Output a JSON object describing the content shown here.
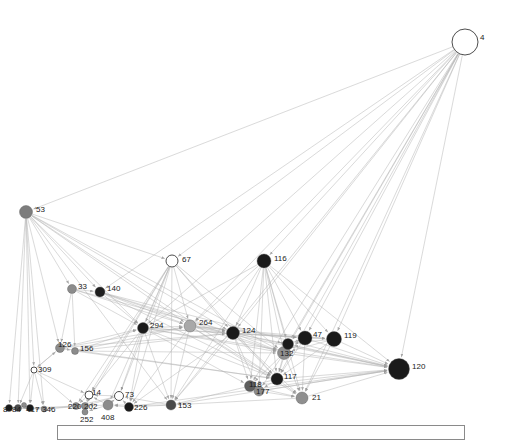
{
  "figure": {
    "type": "network-graph",
    "width": 511,
    "height": 440,
    "background": "#ffffff",
    "edge_color": "#b0b0b0",
    "arrow_color": "#9a9a9a",
    "label_color": "#1a1a1a",
    "node_stroke": "#555555"
  },
  "legend_panel": {
    "x": 57,
    "y": 425,
    "width": 408,
    "height": 15,
    "border_color": "#8a8a8a"
  },
  "chart_data": {
    "type": "scatter",
    "title": "",
    "xlabel": "",
    "ylabel": "",
    "nodes": [
      {
        "id": "4",
        "x": 465,
        "y": 42,
        "r": 13.0,
        "color": "#ffffff"
      },
      {
        "id": "53",
        "x": 26,
        "y": 212,
        "r": 6.5,
        "color": "#7d7d7d"
      },
      {
        "id": "67",
        "x": 172,
        "y": 261,
        "r": 6.0,
        "color": "#ffffff"
      },
      {
        "id": "116",
        "x": 264,
        "y": 261,
        "r": 7.0,
        "color": "#1a1a1a"
      },
      {
        "id": "33",
        "x": 72,
        "y": 289,
        "r": 4.5,
        "color": "#8c8c8c"
      },
      {
        "id": "140",
        "x": 100,
        "y": 292,
        "r": 5.0,
        "color": "#1f1f1f"
      },
      {
        "id": "294",
        "x": 143,
        "y": 328,
        "r": 5.5,
        "color": "#1a1a1a"
      },
      {
        "id": "264",
        "x": 190,
        "y": 326,
        "r": 6.0,
        "color": "#a8a8a8"
      },
      {
        "id": "124",
        "x": 233,
        "y": 333,
        "r": 6.5,
        "color": "#1a1a1a"
      },
      {
        "id": "47",
        "x": 305,
        "y": 338,
        "r": 7.0,
        "color": "#1a1a1a"
      },
      {
        "id": "119",
        "x": 334,
        "y": 339,
        "r": 7.5,
        "color": "#1a1a1a"
      },
      {
        "id": "126",
        "x": 60,
        "y": 348,
        "r": 4.5,
        "color": "#8c8c8c"
      },
      {
        "id": "156",
        "x": 75,
        "y": 351,
        "r": 3.5,
        "color": "#8c8c8c"
      },
      {
        "id": "132",
        "x": 284,
        "y": 353,
        "r": 6.5,
        "color": "#8f8f8f"
      },
      {
        "id": "286",
        "x": 288,
        "y": 344,
        "r": 5.5,
        "color": "#1a1a1a"
      },
      {
        "id": "309",
        "x": 34,
        "y": 370,
        "r": 3.0,
        "color": "#ffffff"
      },
      {
        "id": "120",
        "x": 399,
        "y": 369,
        "r": 10.5,
        "color": "#1a1a1a"
      },
      {
        "id": "117",
        "x": 277,
        "y": 379,
        "r": 6.0,
        "color": "#1a1a1a"
      },
      {
        "id": "118",
        "x": 250,
        "y": 386,
        "r": 5.5,
        "color": "#5e5e5e"
      },
      {
        "id": "177",
        "x": 259,
        "y": 391,
        "r": 5.0,
        "color": "#8c8c8c"
      },
      {
        "id": "21",
        "x": 302,
        "y": 398,
        "r": 6.0,
        "color": "#8f8f8f"
      },
      {
        "id": "14",
        "x": 89,
        "y": 395,
        "r": 4.0,
        "color": "#ffffff"
      },
      {
        "id": "73",
        "x": 119,
        "y": 396,
        "r": 4.5,
        "color": "#ffffff"
      },
      {
        "id": "220",
        "x": 76,
        "y": 406,
        "r": 3.5,
        "color": "#8c8c8c"
      },
      {
        "id": "202",
        "x": 85,
        "y": 406,
        "r": 3.5,
        "color": "#8c8c8c"
      },
      {
        "id": "252",
        "x": 85,
        "y": 412,
        "r": 3.0,
        "color": "#8c8c8c"
      },
      {
        "id": "408",
        "x": 108,
        "y": 405,
        "r": 5.0,
        "color": "#8c8c8c"
      },
      {
        "id": "226",
        "x": 129,
        "y": 407,
        "r": 4.5,
        "color": "#1a1a1a"
      },
      {
        "id": "153",
        "x": 171,
        "y": 405,
        "r": 5.0,
        "color": "#4a4a4a"
      },
      {
        "id": "346",
        "x": 44,
        "y": 409,
        "r": 3.0,
        "color": "#8c8c8c"
      },
      {
        "id": "417",
        "x": 30,
        "y": 408,
        "r": 3.5,
        "color": "#1a1a1a"
      },
      {
        "id": "84",
        "x": 18,
        "y": 408,
        "r": 3.5,
        "color": "#4a4a4a"
      },
      {
        "id": "8",
        "x": 9,
        "y": 408,
        "r": 3.5,
        "color": "#1a1a1a"
      },
      {
        "id": "3",
        "x": 24,
        "y": 405,
        "r": 2.5,
        "color": "#8c8c8c"
      }
    ],
    "labels": [
      {
        "text": "4",
        "x": 480,
        "y": 34
      },
      {
        "text": "53",
        "x": 36,
        "y": 206
      },
      {
        "text": "67",
        "x": 182,
        "y": 256
      },
      {
        "text": "116",
        "x": 274,
        "y": 255
      },
      {
        "text": "33",
        "x": 78,
        "y": 283
      },
      {
        "text": "140",
        "x": 107,
        "y": 285
      },
      {
        "text": "294",
        "x": 150,
        "y": 322
      },
      {
        "text": "264",
        "x": 199,
        "y": 319
      },
      {
        "text": "124",
        "x": 242,
        "y": 327
      },
      {
        "text": "47",
        "x": 313,
        "y": 331
      },
      {
        "text": "119",
        "x": 344,
        "y": 332
      },
      {
        "text": "126",
        "x": 58,
        "y": 341
      },
      {
        "text": "156",
        "x": 80,
        "y": 345
      },
      {
        "text": "132",
        "x": 280,
        "y": 350
      },
      {
        "text": "309",
        "x": 38,
        "y": 366
      },
      {
        "text": "120",
        "x": 412,
        "y": 363
      },
      {
        "text": "117",
        "x": 284,
        "y": 373
      },
      {
        "text": "118",
        "x": 249,
        "y": 381
      },
      {
        "text": "177",
        "x": 256,
        "y": 388
      },
      {
        "text": "21",
        "x": 312,
        "y": 394
      },
      {
        "text": "14",
        "x": 92,
        "y": 389
      },
      {
        "text": "73",
        "x": 125,
        "y": 391
      },
      {
        "text": "220",
        "x": 68,
        "y": 403
      },
      {
        "text": "202",
        "x": 84,
        "y": 403
      },
      {
        "text": "252",
        "x": 80,
        "y": 416
      },
      {
        "text": "408",
        "x": 101,
        "y": 414
      },
      {
        "text": "226",
        "x": 134,
        "y": 404
      },
      {
        "text": "153",
        "x": 178,
        "y": 402
      },
      {
        "text": "346",
        "x": 42,
        "y": 406
      },
      {
        "text": "417",
        "x": 26,
        "y": 406
      },
      {
        "text": "84",
        "x": 12,
        "y": 406
      },
      {
        "text": "8",
        "x": 3,
        "y": 406
      }
    ],
    "edges": [
      [
        "4",
        "53"
      ],
      [
        "4",
        "67"
      ],
      [
        "4",
        "116"
      ],
      [
        "4",
        "294"
      ],
      [
        "4",
        "264"
      ],
      [
        "4",
        "124"
      ],
      [
        "4",
        "47"
      ],
      [
        "4",
        "119"
      ],
      [
        "4",
        "132"
      ],
      [
        "4",
        "120"
      ],
      [
        "4",
        "117"
      ],
      [
        "4",
        "21"
      ],
      [
        "4",
        "140"
      ],
      [
        "4",
        "153"
      ],
      [
        "4",
        "118"
      ],
      [
        "4",
        "286"
      ],
      [
        "53",
        "33"
      ],
      [
        "53",
        "140"
      ],
      [
        "53",
        "126"
      ],
      [
        "53",
        "8"
      ],
      [
        "53",
        "84"
      ],
      [
        "53",
        "417"
      ],
      [
        "53",
        "346"
      ],
      [
        "53",
        "309"
      ],
      [
        "53",
        "67"
      ],
      [
        "53",
        "294"
      ],
      [
        "67",
        "294"
      ],
      [
        "67",
        "264"
      ],
      [
        "67",
        "124"
      ],
      [
        "67",
        "132"
      ],
      [
        "67",
        "117"
      ],
      [
        "67",
        "14"
      ],
      [
        "67",
        "73"
      ],
      [
        "67",
        "220"
      ],
      [
        "67",
        "202"
      ],
      [
        "67",
        "408"
      ],
      [
        "116",
        "294"
      ],
      [
        "116",
        "264"
      ],
      [
        "116",
        "124"
      ],
      [
        "116",
        "132"
      ],
      [
        "116",
        "47"
      ],
      [
        "116",
        "119"
      ],
      [
        "116",
        "117"
      ],
      [
        "116",
        "120"
      ],
      [
        "116",
        "118"
      ],
      [
        "116",
        "177"
      ],
      [
        "116",
        "21"
      ],
      [
        "116",
        "153"
      ],
      [
        "116",
        "286"
      ],
      [
        "33",
        "140"
      ],
      [
        "33",
        "126"
      ],
      [
        "33",
        "156"
      ],
      [
        "33",
        "294"
      ],
      [
        "140",
        "294"
      ],
      [
        "140",
        "264"
      ],
      [
        "140",
        "124"
      ],
      [
        "140",
        "120"
      ],
      [
        "126",
        "156"
      ],
      [
        "126",
        "294"
      ],
      [
        "126",
        "124"
      ],
      [
        "126",
        "264"
      ],
      [
        "126",
        "309"
      ],
      [
        "156",
        "294"
      ],
      [
        "156",
        "124"
      ],
      [
        "156",
        "132"
      ],
      [
        "309",
        "84"
      ],
      [
        "309",
        "417"
      ],
      [
        "309",
        "346"
      ],
      [
        "309",
        "220"
      ],
      [
        "294",
        "264"
      ],
      [
        "294",
        "124"
      ],
      [
        "294",
        "132"
      ],
      [
        "294",
        "117"
      ],
      [
        "294",
        "118"
      ],
      [
        "294",
        "226"
      ],
      [
        "294",
        "153"
      ],
      [
        "294",
        "120"
      ],
      [
        "294",
        "47"
      ],
      [
        "264",
        "124"
      ],
      [
        "264",
        "132"
      ],
      [
        "264",
        "47"
      ],
      [
        "264",
        "119"
      ],
      [
        "264",
        "120"
      ],
      [
        "264",
        "117"
      ],
      [
        "264",
        "21"
      ],
      [
        "264",
        "153"
      ],
      [
        "124",
        "132"
      ],
      [
        "124",
        "47"
      ],
      [
        "124",
        "119"
      ],
      [
        "124",
        "117"
      ],
      [
        "124",
        "118"
      ],
      [
        "124",
        "177"
      ],
      [
        "124",
        "21"
      ],
      [
        "124",
        "120"
      ],
      [
        "124",
        "286"
      ],
      [
        "124",
        "153"
      ],
      [
        "47",
        "119"
      ],
      [
        "47",
        "132"
      ],
      [
        "47",
        "117"
      ],
      [
        "47",
        "120"
      ],
      [
        "47",
        "21"
      ],
      [
        "47",
        "286"
      ],
      [
        "119",
        "120"
      ],
      [
        "119",
        "132"
      ],
      [
        "119",
        "117"
      ],
      [
        "119",
        "21"
      ],
      [
        "119",
        "286"
      ],
      [
        "132",
        "117"
      ],
      [
        "132",
        "118"
      ],
      [
        "132",
        "177"
      ],
      [
        "132",
        "21"
      ],
      [
        "132",
        "120"
      ],
      [
        "132",
        "286"
      ],
      [
        "117",
        "118"
      ],
      [
        "117",
        "177"
      ],
      [
        "117",
        "21"
      ],
      [
        "117",
        "120"
      ],
      [
        "118",
        "177"
      ],
      [
        "118",
        "21"
      ],
      [
        "118",
        "120"
      ],
      [
        "118",
        "153"
      ],
      [
        "177",
        "21"
      ],
      [
        "177",
        "120"
      ],
      [
        "21",
        "120"
      ],
      [
        "21",
        "153"
      ],
      [
        "153",
        "226"
      ],
      [
        "153",
        "408"
      ],
      [
        "153",
        "120"
      ],
      [
        "153",
        "73"
      ],
      [
        "226",
        "408"
      ],
      [
        "226",
        "73"
      ],
      [
        "226",
        "120"
      ],
      [
        "408",
        "73"
      ],
      [
        "408",
        "14"
      ],
      [
        "408",
        "202"
      ],
      [
        "408",
        "252"
      ],
      [
        "73",
        "14"
      ],
      [
        "73",
        "202"
      ],
      [
        "73",
        "220"
      ],
      [
        "14",
        "220"
      ],
      [
        "14",
        "202"
      ],
      [
        "14",
        "252"
      ],
      [
        "220",
        "202"
      ],
      [
        "202",
        "252"
      ],
      [
        "220",
        "346"
      ],
      [
        "202",
        "346"
      ],
      [
        "346",
        "417"
      ],
      [
        "417",
        "84"
      ],
      [
        "84",
        "8"
      ],
      [
        "8",
        "3"
      ],
      [
        "3",
        "417"
      ],
      [
        "8",
        "346"
      ],
      [
        "84",
        "346"
      ],
      [
        "417",
        "220"
      ],
      [
        "120",
        "286"
      ],
      [
        "286",
        "132"
      ],
      [
        "286",
        "117"
      ],
      [
        "53",
        "124"
      ],
      [
        "53",
        "264"
      ],
      [
        "53",
        "132"
      ],
      [
        "53",
        "117"
      ],
      [
        "53",
        "153"
      ],
      [
        "140",
        "117"
      ],
      [
        "140",
        "132"
      ],
      [
        "33",
        "124"
      ],
      [
        "294",
        "14"
      ],
      [
        "294",
        "73"
      ],
      [
        "264",
        "226"
      ],
      [
        "124",
        "226"
      ],
      [
        "126",
        "117"
      ],
      [
        "156",
        "117"
      ],
      [
        "67",
        "153"
      ],
      [
        "67",
        "226"
      ],
      [
        "309",
        "14"
      ],
      [
        "309",
        "126"
      ],
      [
        "156",
        "264"
      ],
      [
        "33",
        "264"
      ]
    ]
  }
}
